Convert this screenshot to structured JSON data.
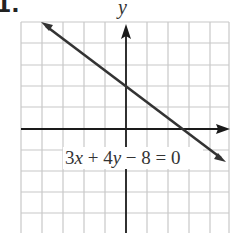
{
  "problem": {
    "number": "1."
  },
  "chart_data": {
    "type": "line",
    "title": "",
    "equation": "3x + 4y − 8 = 0",
    "equation_parts": {
      "a": "3x",
      "plus": "+",
      "b": "4y",
      "minus": "−",
      "c": "8",
      "eq": "=",
      "d": "0"
    },
    "xlabel": "",
    "ylabel": "y",
    "grid": true,
    "grid_spacing": 1,
    "xlim": [
      -5,
      5
    ],
    "ylim": [
      -5,
      5
    ],
    "line": {
      "slope": -0.75,
      "y_intercept": 2,
      "x_intercept": 2.667,
      "x": [
        -4,
        4.7
      ],
      "y": [
        5,
        -1.5
      ],
      "arrows_both_ends": true
    },
    "axes_arrows": {
      "x": "right",
      "y": "up"
    },
    "colors": {
      "grid": "#c8c8c8",
      "axis": "#1a1a1a",
      "line": "#333333"
    }
  }
}
